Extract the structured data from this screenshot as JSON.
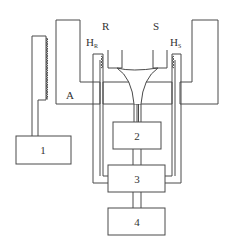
{
  "diagram": {
    "type": "apparatus-schematic",
    "labels": {
      "block_A": "A",
      "reference_cell": "R",
      "sample_cell": "S",
      "heater_R": "H",
      "heater_R_sub": "R",
      "heater_S": "H",
      "heater_S_sub": "S"
    },
    "boxes": [
      {
        "id": "1",
        "label": "1"
      },
      {
        "id": "2",
        "label": "2"
      },
      {
        "id": "3",
        "label": "3"
      },
      {
        "id": "4",
        "label": "4"
      }
    ],
    "colors": {
      "line": "#4a4a4a",
      "text": "#333333",
      "background": "#ffffff"
    }
  }
}
